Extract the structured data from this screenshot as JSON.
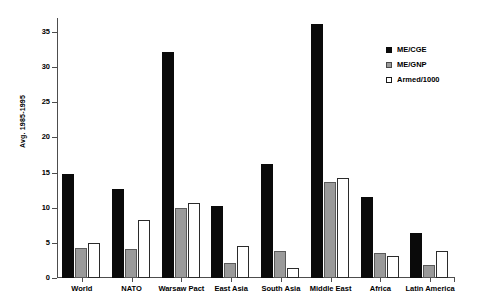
{
  "chart_data": {
    "type": "bar",
    "title": "",
    "xlabel": "",
    "ylabel": "Avg. 1985-1995",
    "ylim": [
      0,
      37
    ],
    "yticks": [
      0,
      5,
      10,
      15,
      20,
      25,
      30,
      35
    ],
    "ytick_labels": [
      "0",
      "5",
      "10",
      "15",
      "20",
      "25",
      "30",
      "35"
    ],
    "grid": false,
    "legend_position": "upper right",
    "categories": [
      "World",
      "NATO",
      "Warsaw Pact",
      "East Asia",
      "South Asia",
      "Middle East",
      "Africa",
      "Latin America"
    ],
    "series": [
      {
        "name": "ME/CGE",
        "color": "#0a0a0a",
        "values": [
          14.8,
          12.6,
          32.2,
          10.3,
          16.2,
          36.2,
          11.5,
          6.4
        ]
      },
      {
        "name": "ME/GNP",
        "color": "#9a9a9a",
        "values": [
          4.3,
          4.2,
          10.0,
          2.2,
          3.8,
          13.6,
          3.6,
          1.9
        ]
      },
      {
        "name": "Armed/1000",
        "color": "#ffffff",
        "values": [
          5.0,
          8.2,
          10.7,
          4.6,
          1.4,
          14.3,
          3.1,
          3.9
        ]
      }
    ]
  }
}
